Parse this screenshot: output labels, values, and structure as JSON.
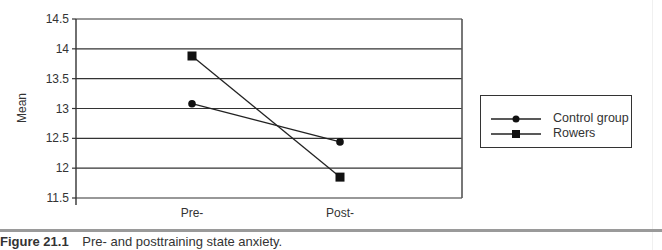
{
  "chart_data": {
    "type": "line",
    "title": "",
    "xlabel": "",
    "ylabel": "Mean",
    "categories": [
      "Pre-",
      "Post-"
    ],
    "series": [
      {
        "name": "Control group",
        "marker": "circle",
        "values": [
          13.08,
          12.44
        ]
      },
      {
        "name": "Rowers",
        "marker": "square",
        "values": [
          13.88,
          11.85
        ]
      }
    ],
    "ylim": [
      11.5,
      14.5
    ],
    "yticks": [
      "14.5",
      "14",
      "13.5",
      "13",
      "12.5",
      "12",
      "11.5"
    ],
    "grid": true,
    "legend_position": "right"
  },
  "legend": {
    "items": [
      {
        "label": "Control group"
      },
      {
        "label": "Rowers"
      }
    ]
  },
  "caption": {
    "figure_number": "Figure 21.1",
    "text": "Pre- and posttraining state anxiety."
  }
}
